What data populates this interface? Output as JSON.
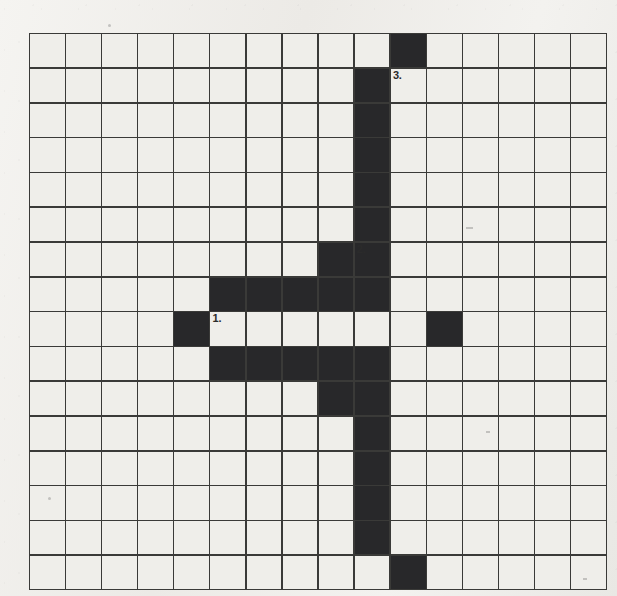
{
  "puzzle": {
    "title": "Crossword-style filled grid",
    "grid": {
      "columns": 16,
      "rows": 16,
      "cell_width": 34.6,
      "cell_height": 33.3,
      "origin_x": 29,
      "origin_y": 33,
      "line_color": "#3a3a38",
      "empty_color": "#efeeea",
      "filled_color": "#28282a"
    },
    "filled_cells": [
      [
        0,
        10
      ],
      [
        1,
        9
      ],
      [
        2,
        9
      ],
      [
        3,
        9
      ],
      [
        4,
        9
      ],
      [
        5,
        9
      ],
      [
        6,
        8
      ],
      [
        6,
        9
      ],
      [
        7,
        5
      ],
      [
        7,
        6
      ],
      [
        7,
        7
      ],
      [
        7,
        8
      ],
      [
        7,
        9
      ],
      [
        8,
        4
      ],
      [
        8,
        11
      ],
      [
        9,
        5
      ],
      [
        9,
        6
      ],
      [
        9,
        7
      ],
      [
        9,
        8
      ],
      [
        9,
        9
      ],
      [
        10,
        8
      ],
      [
        10,
        9
      ],
      [
        11,
        9
      ],
      [
        12,
        9
      ],
      [
        13,
        9
      ],
      [
        14,
        9
      ],
      [
        15,
        10
      ]
    ],
    "clue_numbers": [
      {
        "row": 1,
        "col": 10,
        "label": "3."
      },
      {
        "row": 6,
        "col": 9,
        "label": "2."
      },
      {
        "row": 8,
        "col": 5,
        "label": "1."
      }
    ],
    "background_color": "#f2f1ee"
  }
}
